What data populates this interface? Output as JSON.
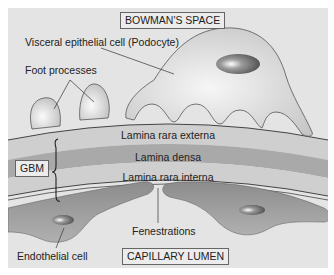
{
  "diagram": {
    "title_box": "BOWMAN'S SPACE",
    "bottom_box": "CAPILLARY LUMEN",
    "gbm_box": "GBM",
    "labels": {
      "podocyte": "Visceral epithelial cell (Podocyte)",
      "foot_processes": "Foot processes",
      "lamina_rara_externa": "Lamina rara externa",
      "lamina_densa": "Lamina densa",
      "lamina_rara_interna": "Lamina rara interna",
      "fenestrations": "Fenestrations",
      "endothelial_cell": "Endothelial cell"
    },
    "colors": {
      "background": "#e4e4e4",
      "cell_fill": "#d8d8d8",
      "cell_highlight": "#f4f4f4",
      "rara_layer": "#cfcfcf",
      "densa_layer": "#a9a9a9",
      "endothelium": "#9c9c9c",
      "nucleus": "#6e6e6e",
      "outline": "#444444"
    }
  }
}
